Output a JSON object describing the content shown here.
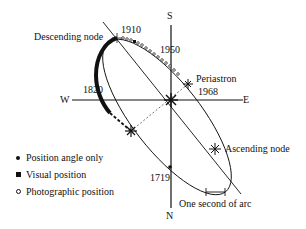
{
  "diagram": {
    "directions": {
      "north": "N",
      "south": "S",
      "east": "E",
      "west": "W"
    },
    "labels": {
      "descending_node": "Descending node",
      "ascending_node": "Ascending node",
      "periastron": "Periastron",
      "year_1910": "1910",
      "year_1950": "1950",
      "year_1968": "1968",
      "year_1820": "1820",
      "year_1719": "1719",
      "scale": "One second of arc"
    },
    "legend": [
      {
        "symbol": "dot",
        "label": "Position angle only"
      },
      {
        "symbol": "square",
        "label": "Visual position"
      },
      {
        "symbol": "circle",
        "label": "Photographic position"
      }
    ],
    "colors": {
      "ink": "#111111",
      "background": "#ffffff"
    }
  }
}
